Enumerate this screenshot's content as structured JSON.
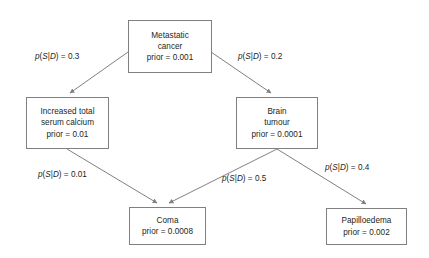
{
  "diagram": {
    "type": "bayesian-network",
    "title": "",
    "line_color": "#808080",
    "text_color": "#231f20",
    "background": "#ffffff",
    "nodes": [
      {
        "id": "metastatic-cancer",
        "lines": [
          "Metastatic",
          "cancer"
        ],
        "line1": "Metastatic",
        "line2": "cancer",
        "prior_text": "prior = 0.001",
        "prior_value": 0.001
      },
      {
        "id": "increased-total-serum-calcium",
        "lines": [
          "Increased total",
          "serum calcium"
        ],
        "line1": "Increased total",
        "line2": "serum calcium",
        "prior_text": "prior = 0.01",
        "prior_value": 0.01
      },
      {
        "id": "brain-tumour",
        "lines": [
          "Brain",
          "tumour"
        ],
        "line1": "Brain",
        "line2": "tumour",
        "prior_text": "prior = 0.0001",
        "prior_value": 0.0001
      },
      {
        "id": "coma",
        "lines": [
          "Coma"
        ],
        "line1": "Coma",
        "line2": "",
        "prior_text": "prior = 0.0008",
        "prior_value": 0.0008
      },
      {
        "id": "papilloedema",
        "lines": [
          "Papilloedema"
        ],
        "line1": "Papilloedema",
        "line2": "",
        "prior_text": "prior = 0.002",
        "prior_value": 0.002
      }
    ],
    "edges": [
      {
        "id": "metastatic-cancer-to-serum-calcium",
        "from": "metastatic-cancer",
        "to": "increased-total-serum-calcium",
        "label_prefix": "p",
        "label_open": "(",
        "label_s": "S",
        "label_bar": "|",
        "label_d": "D",
        "label_close": ")",
        "label_equals": " = ",
        "value": "0.3"
      },
      {
        "id": "metastatic-cancer-to-brain-tumour",
        "from": "metastatic-cancer",
        "to": "brain-tumour",
        "label_prefix": "p",
        "label_open": "(",
        "label_s": "S",
        "label_bar": "|",
        "label_d": "D",
        "label_close": ")",
        "label_equals": " = ",
        "value": "0.2"
      },
      {
        "id": "serum-calcium-to-coma",
        "from": "increased-total-serum-calcium",
        "to": "coma",
        "label_prefix": "p",
        "label_open": "(",
        "label_s": "S",
        "label_bar": "|",
        "label_d": "D",
        "label_close": ")",
        "label_equals": " = ",
        "value": "0.01"
      },
      {
        "id": "brain-tumour-to-coma",
        "from": "brain-tumour",
        "to": "coma",
        "label_prefix": "p",
        "label_open": "(",
        "label_s": "S",
        "label_bar": "|",
        "label_d": "D",
        "label_close": ")",
        "label_equals": " = ",
        "value": "0.5"
      },
      {
        "id": "brain-tumour-to-papilloedema",
        "from": "brain-tumour",
        "to": "papilloedema",
        "label_prefix": "p",
        "label_open": "(",
        "label_s": "S",
        "label_bar": "|",
        "label_d": "D",
        "label_close": ")",
        "label_equals": " = ",
        "value": "0.4"
      }
    ]
  }
}
